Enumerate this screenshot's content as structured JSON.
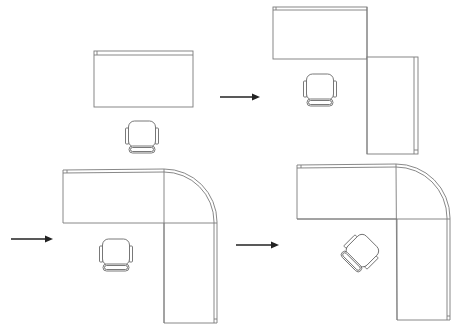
{
  "diagram": {
    "type": "office-desk-layout-progression",
    "colors": {
      "outline": "#7a7a7a",
      "arrow": "#222222",
      "background": "#ffffff"
    },
    "layouts": [
      {
        "id": "straight-desk",
        "label": "Straight desk",
        "chair_orientation": "facing-up"
      },
      {
        "id": "l-shaped-desk",
        "label": "L-shaped desk",
        "chair_orientation": "facing-up"
      },
      {
        "id": "curved-corner-desk",
        "label": "Curved corner L-desk",
        "chair_orientation": "facing-up"
      },
      {
        "id": "curved-corner-desk-rotated-chair",
        "label": "Curved corner L-desk with angled chair",
        "chair_orientation": "facing-corner"
      }
    ],
    "arrows": [
      {
        "from": "straight-desk",
        "to": "l-shaped-desk",
        "direction": "right"
      },
      {
        "from": "l-shaped-desk",
        "to": "curved-corner-desk",
        "direction": "right"
      },
      {
        "from": "curved-corner-desk",
        "to": "curved-corner-desk-rotated-chair",
        "direction": "right"
      }
    ]
  }
}
